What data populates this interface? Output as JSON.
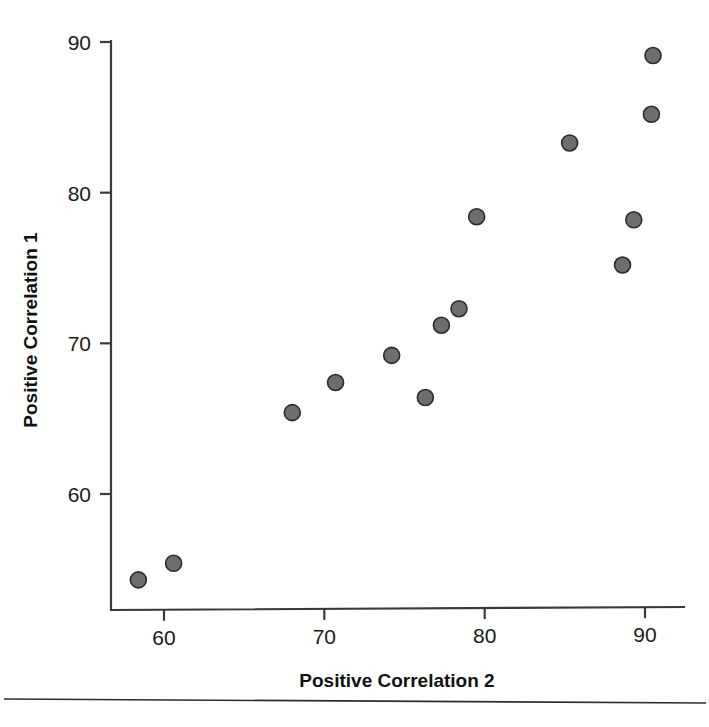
{
  "chart_data": {
    "type": "scatter",
    "title": "",
    "xlabel": "Positive Correlation 2",
    "ylabel": "Positive Correlation 1",
    "xlim": [
      56.2,
      92.0
    ],
    "ylim": [
      52.2,
      90.8
    ],
    "xticks": [
      60,
      70,
      80,
      90
    ],
    "xtick_labels": [
      "60",
      "70",
      "80",
      "90"
    ],
    "yticks": [
      60,
      70,
      80,
      90
    ],
    "ytick_labels": [
      "60",
      "70",
      "80",
      "90"
    ],
    "grid": false,
    "legend": false,
    "marker": {
      "shape": "circle",
      "size_px": 16,
      "fill_color": "#6e6e6e",
      "edge_color": "#2b2b2b"
    },
    "series": [
      {
        "name": "observations",
        "points": [
          {
            "x": 58.4,
            "y": 54.3
          },
          {
            "x": 60.6,
            "y": 55.4
          },
          {
            "x": 68.0,
            "y": 65.4
          },
          {
            "x": 70.7,
            "y": 67.4
          },
          {
            "x": 74.2,
            "y": 69.2
          },
          {
            "x": 76.3,
            "y": 66.4
          },
          {
            "x": 77.3,
            "y": 71.2
          },
          {
            "x": 78.4,
            "y": 72.3
          },
          {
            "x": 79.5,
            "y": 78.4
          },
          {
            "x": 85.3,
            "y": 83.3
          },
          {
            "x": 88.6,
            "y": 75.2
          },
          {
            "x": 89.3,
            "y": 78.2
          },
          {
            "x": 90.4,
            "y": 85.2
          },
          {
            "x": 90.5,
            "y": 89.1
          }
        ]
      }
    ]
  },
  "figure": {
    "background_color": "#ffffff",
    "axis_color": "#3a3a3a",
    "text_color": "#111111",
    "footer_rule_color": "#2e2e2e"
  }
}
